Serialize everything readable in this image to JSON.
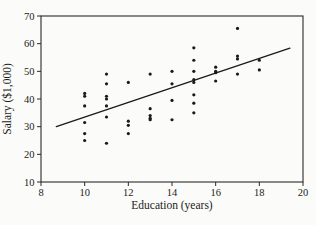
{
  "figure": {
    "background_color": "#fbfbf9",
    "frame_color": "#2a2a2a",
    "ink_color": "#1a1a1a"
  },
  "chart_data": {
    "type": "scatter",
    "title": "",
    "xlabel": "Education (years)",
    "ylabel": "Salary ($1,000)",
    "xlim": [
      8,
      20
    ],
    "ylim": [
      10,
      70
    ],
    "xticks": [
      8,
      10,
      12,
      14,
      16,
      18,
      20
    ],
    "yticks": [
      10,
      20,
      30,
      40,
      50,
      60,
      70
    ],
    "grid": false,
    "legend": "none",
    "marker": "dot",
    "point_color": "#1a1a1a",
    "line_color": "#1a1a1a",
    "points": [
      [
        10,
        42
      ],
      [
        10,
        41
      ],
      [
        10,
        37.5
      ],
      [
        10,
        31.5
      ],
      [
        10,
        27.5
      ],
      [
        10,
        25
      ],
      [
        11,
        49
      ],
      [
        11,
        45.5
      ],
      [
        11,
        41
      ],
      [
        11,
        40
      ],
      [
        11,
        37.5
      ],
      [
        11,
        33.5
      ],
      [
        11,
        24
      ],
      [
        12,
        46
      ],
      [
        12,
        32
      ],
      [
        12,
        30.5
      ],
      [
        12,
        27.5
      ],
      [
        13,
        49
      ],
      [
        13,
        36.5
      ],
      [
        13,
        34
      ],
      [
        13,
        33
      ],
      [
        13,
        32.5
      ],
      [
        14,
        50
      ],
      [
        14,
        45.5
      ],
      [
        14,
        39.5
      ],
      [
        14,
        32.5
      ],
      [
        15,
        58.5
      ],
      [
        15,
        54
      ],
      [
        15,
        50
      ],
      [
        15,
        47
      ],
      [
        15,
        46
      ],
      [
        15,
        41.5
      ],
      [
        15,
        38.5
      ],
      [
        15,
        35
      ],
      [
        16,
        51.5
      ],
      [
        16,
        50
      ],
      [
        16,
        49.5
      ],
      [
        16,
        46.5
      ],
      [
        17,
        65.5
      ],
      [
        17,
        55.5
      ],
      [
        17,
        54.5
      ],
      [
        17,
        49
      ],
      [
        18,
        54
      ],
      [
        18,
        50.5
      ]
    ],
    "trend_line": {
      "x1": 8.7,
      "y1": 30,
      "x2": 19.4,
      "y2": 58.4
    }
  },
  "layout_px": {
    "plot_left": 41,
    "plot_right": 303,
    "plot_top": 16,
    "plot_bottom": 182,
    "tick_len": 4,
    "point_radius": 1.6
  }
}
